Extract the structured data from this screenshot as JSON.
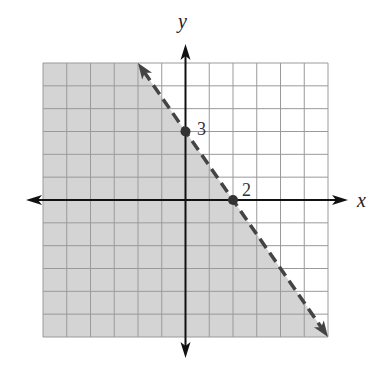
{
  "chart_data": {
    "type": "line",
    "title": "",
    "xlabel": "x",
    "ylabel": "y",
    "xlim": [
      -6,
      6
    ],
    "ylim": [
      -6,
      6
    ],
    "grid": true,
    "grid_step": 1,
    "boundary_line": {
      "equation": "y = -3/2 x + 3",
      "slope": -1.5,
      "intercept": 3,
      "style": "dashed",
      "endpoints": [
        [
          -2,
          6
        ],
        [
          6,
          -6
        ]
      ]
    },
    "shaded_region": "below-left of line (y < -3/2 x + 3)",
    "points": [
      {
        "x": 0,
        "y": 3,
        "label": "3"
      },
      {
        "x": 2,
        "y": 0,
        "label": "2"
      }
    ],
    "colors": {
      "shade": "#d4d4d4",
      "grid": "#9a9a9a",
      "axes": "#111111",
      "line": "#444444"
    }
  },
  "axes": {
    "x_label": "x",
    "y_label": "y"
  },
  "annotations": {
    "y_intercept_label": "3",
    "x_intercept_label": "2"
  }
}
